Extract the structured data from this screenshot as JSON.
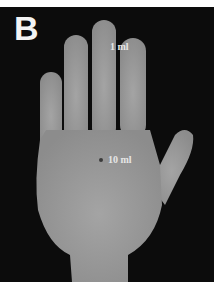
{
  "figure": {
    "panel_label": "B",
    "annotations": [
      {
        "label": "1 ml",
        "location": "middle-finger"
      },
      {
        "label": "10 ml",
        "location": "palm-center"
      }
    ],
    "colors": {
      "background": "#0c0c0c",
      "skin": "#9a9a9a",
      "border": "#ffffff"
    }
  }
}
